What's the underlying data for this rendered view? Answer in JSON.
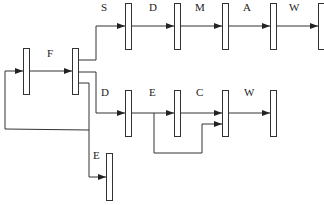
{
  "diagram": {
    "type": "block-flow",
    "labels": {
      "F": "F",
      "top": [
        "S",
        "D",
        "M",
        "A",
        "W"
      ],
      "middle": [
        "D",
        "E",
        "C",
        "W"
      ],
      "bottom": "E"
    },
    "nodes": [
      {
        "id": "n1",
        "role": "input-stage"
      },
      {
        "id": "n2",
        "role": "split-stage"
      },
      {
        "id": "t1"
      },
      {
        "id": "t2"
      },
      {
        "id": "t3"
      },
      {
        "id": "t4"
      },
      {
        "id": "t5"
      },
      {
        "id": "m1"
      },
      {
        "id": "m2"
      },
      {
        "id": "m3"
      },
      {
        "id": "m4"
      },
      {
        "id": "b1"
      }
    ],
    "edges": [
      {
        "from": "n1",
        "to": "n2",
        "label": "F"
      },
      {
        "from": "n2",
        "to": "t1",
        "label": "S"
      },
      {
        "from": "t1",
        "to": "t2",
        "label": "D"
      },
      {
        "from": "t2",
        "to": "t3",
        "label": "M"
      },
      {
        "from": "t3",
        "to": "t4",
        "label": "A"
      },
      {
        "from": "t4",
        "to": "t5",
        "label": "W"
      },
      {
        "from": "n2",
        "to": "m1",
        "label": "D"
      },
      {
        "from": "m1",
        "to": "m2",
        "label": "E"
      },
      {
        "from": "m2",
        "to": "m3",
        "label": "C"
      },
      {
        "from": "m1",
        "to": "m3",
        "label": "skip"
      },
      {
        "from": "m3",
        "to": "m4",
        "label": "W"
      },
      {
        "from": "n2",
        "to": "b1",
        "label": "E"
      },
      {
        "from": "n2",
        "to": "n1",
        "label": "feedback"
      }
    ]
  }
}
